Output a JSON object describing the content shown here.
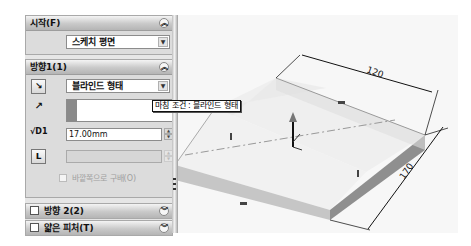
{
  "property_manager": {
    "start_group": {
      "title": "시작(F)",
      "selected_option": "스케치 평면",
      "collapse_icon": "double-chevron-up"
    },
    "direction1_group": {
      "title": "방향1(1)",
      "collapse_icon": "double-chevron-up",
      "end_condition": "블라인드 형태",
      "depth_value": "17.00mm",
      "draft_value": "",
      "reverse_draft_label": "바깥쪽으로 구배(O)",
      "icons": [
        "reverse-direction-icon",
        "direction-arrow-icon",
        "depth-icon",
        "draft-icon"
      ]
    },
    "direction2_group": {
      "title": "방향 2(2)",
      "checked": false,
      "expand_icon": "double-chevron-down"
    },
    "thin_feature_group": {
      "title": "얇은 피처(T)",
      "checked": false,
      "expand_icon": "double-chevron-down"
    }
  },
  "tooltip": {
    "text": "마침 조건 : 블라인드 형태"
  },
  "graphics_area": {
    "dimensions": [
      {
        "label": "120",
        "edge": "width"
      },
      {
        "label": "170",
        "edge": "length"
      }
    ],
    "extrude_depth_handle": "arrow",
    "colors": {
      "top_face": "#ececec",
      "front_face": "#c4c4c4",
      "side_face": "#8e8e8e",
      "dimension_line": "#1a1a1a"
    }
  }
}
